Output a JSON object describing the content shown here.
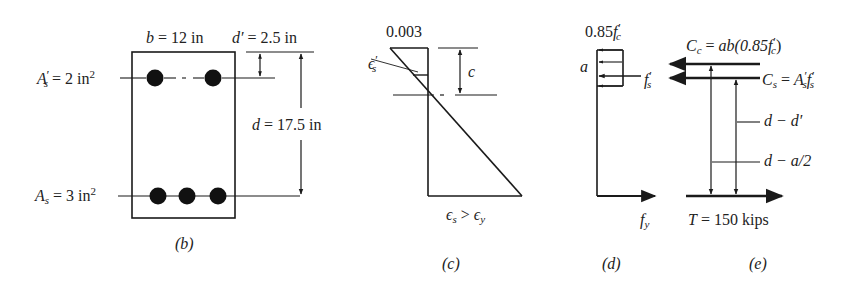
{
  "figure": {
    "panels": [
      {
        "id": "b",
        "caption": "(b)",
        "title": "Beam cross-section"
      },
      {
        "id": "c",
        "caption": "(c)",
        "title": "Strain distribution"
      },
      {
        "id": "d",
        "caption": "(d)",
        "title": "Stress distribution"
      },
      {
        "id": "e",
        "caption": "(e)",
        "title": "Internal forces"
      }
    ]
  },
  "section_b": {
    "caption": "(b)",
    "width_label": {
      "var": "b",
      "eq": " = 12 in"
    },
    "dprime_label": {
      "var": "d′",
      "eq": " = 2.5 in"
    },
    "d_label": {
      "var": "d",
      "eq": " = 17.5 in"
    },
    "comp_steel_label": {
      "var": "A",
      "sub": "s",
      "prime": "′",
      "eq": " = 2 in",
      "sup": "2"
    },
    "tens_steel_label": {
      "var": "A",
      "sub": "s",
      "eq": " = 3 in",
      "sup": "2"
    },
    "top_bars": 2,
    "bottom_bars": 3
  },
  "strain_c": {
    "caption": "(c)",
    "top_strain": "0.003",
    "comp_steel_strain": {
      "sym": "ϵ",
      "sub": "s",
      "prime": "′"
    },
    "neutral_axis_depth": "c",
    "bottom_label": {
      "lhs": "ϵ",
      "lhs_sub": "s",
      "op": " > ",
      "rhs": "ϵ",
      "rhs_sub": "y"
    }
  },
  "stress_d": {
    "caption": "(d)",
    "block_stress": {
      "coef": "0.85",
      "var": "f",
      "prime": "′",
      "sub": "c"
    },
    "block_depth": "a",
    "comp_steel_stress": {
      "var": "f",
      "prime": "′",
      "sub": "s"
    },
    "tens_steel_stress": {
      "var": "f",
      "sub": "y"
    }
  },
  "forces_e": {
    "caption": "(e)",
    "Cc": {
      "lhs": "C",
      "lhs_sub": "c",
      "eq": " = ",
      "rhs": "ab(0.85",
      "rhs_var": "f",
      "rhs_prime": "′",
      "rhs_sub": "c",
      "rhs_close": ")"
    },
    "Cs": {
      "lhs": "C",
      "lhs_sub": "s",
      "eq": " = ",
      "rhs1": "A",
      "rhs1_prime": "′",
      "rhs1_sub": "s",
      "rhs2": "f",
      "rhs2_prime": "′",
      "rhs2_sub": "s"
    },
    "arm1": "d − d′",
    "arm2": "d − a/2",
    "T": {
      "var": "T",
      "eq": " = 150 kips"
    }
  },
  "colors": {
    "ink": "#1a1a1a",
    "background": "#ffffff"
  }
}
